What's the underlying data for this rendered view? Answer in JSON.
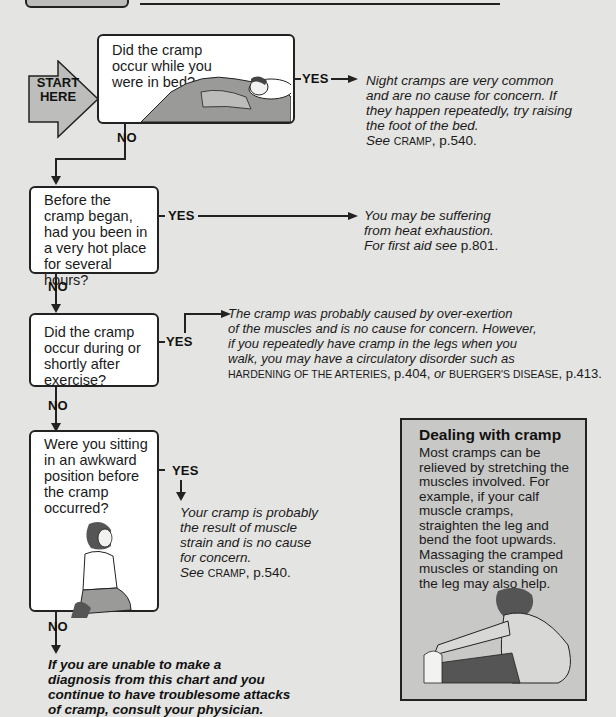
{
  "start": {
    "line1": "START",
    "line2": "HERE"
  },
  "questions": [
    {
      "text": "Did the cramp occur while you were in bed?",
      "yes_label": "YES",
      "no_label": "NO"
    },
    {
      "text": "Before the cramp began, had you been in a very hot place for several hours?",
      "yes_label": "YES",
      "no_label": "NO"
    },
    {
      "text": "Did the cramp occur during or shortly after exercise?",
      "yes_label": "YES",
      "no_label": "NO"
    },
    {
      "text": "Were you sitting in an awkward position before the cramp occurred?",
      "yes_label": "YES",
      "no_label": "NO"
    }
  ],
  "answers": [
    {
      "l1": "Night cramps are very common",
      "l2": "and are no cause for concern. If",
      "l3": "they happen repeatedly, try raising",
      "l4": "the foot of the bed.",
      "see": "See",
      "ref": "CRAMP",
      "page": ", p.540."
    },
    {
      "l1": "You may be suffering",
      "l2": "from heat exhaustion.",
      "l3": "For first aid see",
      "page": "p.801."
    },
    {
      "l1": "The cramp was probably caused by over-exertion",
      "l2": "of the muscles and is no cause for concern. However,",
      "l3": "if you repeatedly have cramp in the legs when you",
      "l4": "walk, you may have a circulatory disorder such as",
      "ref1": "HARDENING OF THE ARTERIES",
      "page1": ", p.404, ",
      "or": "or",
      "ref2": "BUERGER'S DISEASE",
      "page2": ", p.413."
    },
    {
      "l1": "Your cramp is probably",
      "l2": "the result of muscle",
      "l3": "strain and is no cause",
      "l4": "for concern.",
      "see": "See",
      "ref": "CRAMP",
      "page": ", p.540."
    }
  ],
  "final": {
    "l1": "If you are unable to make a",
    "l2": "diagnosis from this chart and you",
    "l3": "continue to have troublesome attacks",
    "l4": "of cramp, consult your physician."
  },
  "tip": {
    "title": "Dealing with cramp",
    "body": "Most cramps can be relieved by stretching the muscles involved. For example, if your calf muscle cramps, straighten the leg and bend the foot upwards. Massaging the cramped muscles or standing on the leg may also help."
  },
  "colors": {
    "background": "#e4e4e2",
    "tip_box": "#c8c8c6",
    "start_arrow": "#bdbdbb",
    "line": "#222222"
  }
}
